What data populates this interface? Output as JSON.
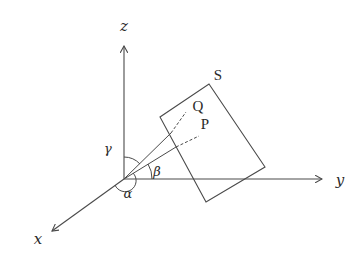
{
  "diagram": {
    "type": "3d-coordinate-geometry",
    "colors": {
      "line": "#4a4a4a",
      "text": "#2a2a2a",
      "background": "#ffffff"
    },
    "origin": {
      "x": 124,
      "y": 179
    },
    "axes": [
      {
        "id": "z",
        "label": "z",
        "end": {
          "x": 124,
          "y": 45
        },
        "label_pos": {
          "x": 124,
          "y": 30
        }
      },
      {
        "id": "y",
        "label": "y",
        "end": {
          "x": 322,
          "y": 179
        },
        "label_pos": {
          "x": 340,
          "y": 185
        }
      },
      {
        "id": "x",
        "label": "x",
        "end": {
          "x": 51,
          "y": 232
        },
        "label_pos": {
          "x": 38,
          "y": 243
        }
      }
    ],
    "plane": {
      "label": "S",
      "corners": [
        {
          "x": 209,
          "y": 84
        },
        {
          "x": 265,
          "y": 167
        },
        {
          "x": 206,
          "y": 202
        },
        {
          "x": 160,
          "y": 117
        }
      ],
      "label_pos": {
        "x": 218,
        "y": 79
      }
    },
    "points": [
      {
        "id": "Q",
        "label": "Q",
        "label_pos": {
          "x": 198,
          "y": 110
        }
      },
      {
        "id": "P",
        "label": "P",
        "label_pos": {
          "x": 199,
          "y": 128
        }
      }
    ],
    "rays": [
      {
        "to": "Q",
        "solid_end": {
          "x": 171,
          "y": 133
        },
        "dashed_end": {
          "x": 186,
          "y": 112
        }
      },
      {
        "to": "P",
        "solid_end": {
          "x": 176,
          "y": 147
        },
        "dashed_end": {
          "x": 199,
          "y": 136
        }
      }
    ],
    "angles": [
      {
        "id": "gamma",
        "label": "γ",
        "between": [
          "z-axis",
          "OQ"
        ],
        "label_pos": {
          "x": 107,
          "y": 153
        }
      },
      {
        "id": "beta",
        "label": "β",
        "between": [
          "y-axis",
          "OP"
        ],
        "label_pos": {
          "x": 156,
          "y": 176
        }
      },
      {
        "id": "alpha",
        "label": "α",
        "between": [
          "x-axis",
          "OP"
        ],
        "label_pos": {
          "x": 128,
          "y": 197
        }
      }
    ]
  }
}
